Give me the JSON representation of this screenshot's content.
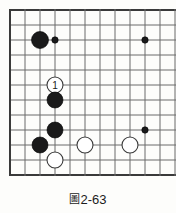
{
  "figure": {
    "caption_label": "圖",
    "caption_number": "2-63",
    "caption_full": "圖2-63"
  },
  "board": {
    "type": "go-board-diagram",
    "origin_x": 10,
    "origin_y": 10,
    "spacing": 15,
    "cols": 11,
    "rows": 12,
    "line_color": "#6b6b6b",
    "edge_color": "#3a3a3a",
    "background": "#fdfdfb",
    "left_edge_is_board_border": true,
    "top_edge_is_board_border": true,
    "bottom_edge_is_board_border": true,
    "right_edge_is_cut_off": true
  },
  "stones": [
    {
      "id": "black-upper-left",
      "color": "black",
      "col": 2,
      "row": 2,
      "radius": 8.5,
      "label": "",
      "kind": "stone"
    },
    {
      "id": "black-marker-upper-left",
      "color": "black",
      "col": 3,
      "row": 2,
      "radius": 3.2,
      "label": "",
      "kind": "point-marker"
    },
    {
      "id": "black-marker-upper-right",
      "color": "black",
      "col": 9,
      "row": 2,
      "radius": 3.2,
      "label": "",
      "kind": "point-marker"
    },
    {
      "id": "white-move-1",
      "color": "white",
      "col": 3,
      "row": 5,
      "radius": 8.0,
      "label": "1",
      "kind": "numbered-stone"
    },
    {
      "id": "black-center-upper",
      "color": "black",
      "col": 3,
      "row": 6,
      "radius": 8.0,
      "label": "",
      "kind": "stone"
    },
    {
      "id": "black-center-lower",
      "color": "black",
      "col": 3,
      "row": 8,
      "radius": 8.0,
      "label": "",
      "kind": "stone"
    },
    {
      "id": "black-lower-left",
      "color": "black",
      "col": 2,
      "row": 9,
      "radius": 8.0,
      "label": "",
      "kind": "stone"
    },
    {
      "id": "white-lower-left",
      "color": "white",
      "col": 3,
      "row": 10,
      "radius": 8.0,
      "label": "",
      "kind": "stone"
    },
    {
      "id": "white-lower-center",
      "color": "white",
      "col": 5,
      "row": 9,
      "radius": 8.0,
      "label": "",
      "kind": "stone"
    },
    {
      "id": "white-lower-right",
      "color": "white",
      "col": 8,
      "row": 9,
      "radius": 8.0,
      "label": "",
      "kind": "stone"
    },
    {
      "id": "black-marker-lower-right",
      "color": "black",
      "col": 9,
      "row": 8,
      "radius": 3.2,
      "label": "",
      "kind": "point-marker"
    }
  ]
}
